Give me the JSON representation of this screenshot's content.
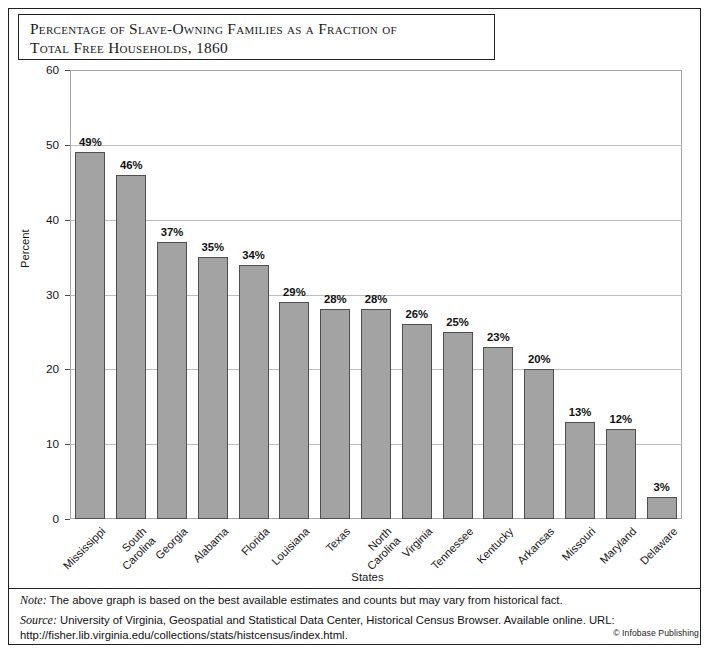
{
  "title": "Percentage of Slave-Owning Families as a Fraction of\nTotal Free Households, 1860",
  "axis": {
    "y_label": "Percent",
    "x_label": "States"
  },
  "footer": {
    "note_label": "Note:",
    "note_text": " The above graph is based on the best available estimates and counts but may vary from historical fact.",
    "source_label": "Source:",
    "source_text": " University of Virginia, Geospatial and Statistical Data Center, Historical Census Browser. Available online. URL: http://fisher.lib.virginia.edu/collections/stats/histcensus/index.html.",
    "copyright": "© Infobase Publishing"
  },
  "colors": {
    "bar_fill": "#a3a3a3",
    "bar_stroke": "#4f4f4f",
    "grid": "#bdbdbd",
    "frame": "#a8a8a8",
    "text": "#111111"
  },
  "chart_data": {
    "type": "bar",
    "title": "Percentage of Slave-Owning Families as a Fraction of Total Free Households, 1860",
    "xlabel": "States",
    "ylabel": "Percent",
    "ylim": [
      0,
      60
    ],
    "yticks": [
      0,
      10,
      20,
      30,
      40,
      50,
      60
    ],
    "ytick_labels": [
      "0",
      "10",
      "20",
      "30",
      "40",
      "50",
      "60"
    ],
    "grid": "horizontal",
    "legend": "none",
    "categories": [
      "Mississippi",
      "South\nCarolina",
      "Georgia",
      "Alabama",
      "Florida",
      "Louisiana",
      "Texas",
      "North\nCarolina",
      "Virginia",
      "Tennessee",
      "Kentucky",
      "Arkansas",
      "Missouri",
      "Maryland",
      "Delaware"
    ],
    "values": [
      49,
      46,
      37,
      35,
      34,
      29,
      28,
      28,
      26,
      25,
      23,
      20,
      13,
      12,
      3
    ],
    "data_labels": [
      "49%",
      "46%",
      "37%",
      "35%",
      "34%",
      "29%",
      "28%",
      "28%",
      "26%",
      "25%",
      "23%",
      "20%",
      "13%",
      "12%",
      "3%"
    ]
  }
}
